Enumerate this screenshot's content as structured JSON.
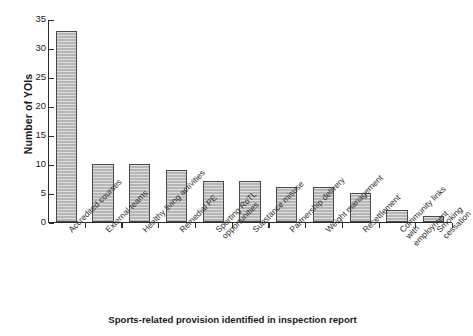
{
  "chart_data": {
    "type": "bar",
    "title": "",
    "xlabel": "Sports-related provision identified in inspection report",
    "ylabel": "Number of YOIs",
    "ylim": [
      0,
      35
    ],
    "ytick_step": 5,
    "yticks": [
      0,
      5,
      10,
      15,
      20,
      25,
      30,
      35
    ],
    "grid": false,
    "legend": "none",
    "bar_color": "#b6b6b6",
    "bar_edge_color": "#4a4a4a",
    "axis_color": "#2b2b2b",
    "categories": [
      "Accredited courses",
      "External teams",
      "Healthy living activities",
      "Remedial PE",
      "Sporting RoTL\nopportunities",
      "Substance misuse",
      "Partnership delivery",
      "Weight management",
      "Resettlement",
      "Community links with\nemployment",
      "Smoking cessation"
    ],
    "values": [
      33,
      10,
      10,
      9,
      7,
      7,
      6,
      6,
      5,
      2,
      1
    ]
  }
}
